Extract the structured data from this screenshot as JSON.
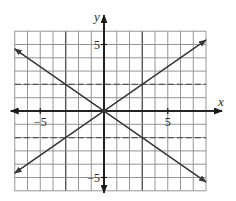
{
  "chart_data": {
    "type": "line",
    "title": "",
    "xlabel": "x",
    "ylabel": "y",
    "xlim": [
      -7,
      8
    ],
    "ylim": [
      -6,
      6
    ],
    "grid": true,
    "legend": null,
    "tick_labels": {
      "x": [
        {
          "value": -5,
          "label": "−5"
        },
        {
          "value": 5,
          "label": "5"
        }
      ],
      "y": [
        {
          "value": 5,
          "label": "5"
        },
        {
          "value": -5,
          "label": "−5"
        }
      ]
    },
    "series": [
      {
        "name": "y = (2/3)x",
        "style": "solid",
        "arrows": "both",
        "x": [
          -7,
          8
        ],
        "y": [
          -4.67,
          5.33
        ]
      },
      {
        "name": "y = -(2/3)x",
        "style": "solid",
        "arrows": "both",
        "x": [
          -7,
          8
        ],
        "y": [
          4.67,
          -5.33
        ]
      },
      {
        "name": "y = 2",
        "style": "dashed",
        "x": [
          -7,
          8
        ],
        "y": [
          2,
          2
        ]
      },
      {
        "name": "y = -2",
        "style": "dashed",
        "x": [
          -7,
          8
        ],
        "y": [
          -2,
          -2
        ]
      }
    ],
    "emphasized_gridlines_x": [
      -3,
      3
    ],
    "intersection_points": [
      [
        -3,
        2
      ],
      [
        3,
        2
      ],
      [
        -3,
        -2
      ],
      [
        3,
        -2
      ],
      [
        0,
        0
      ]
    ]
  },
  "layout": {
    "origin_px": [
      104,
      111
    ],
    "px_per_unit_x": 12.75,
    "px_per_unit_y": 13.3,
    "colors": {
      "axis": "#1a1a1a",
      "grid": "#8a8a8a",
      "line": "#3a3a3a",
      "background": "#ffffff"
    }
  }
}
